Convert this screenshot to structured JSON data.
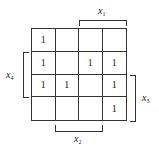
{
  "diagram": {
    "type": "karnaugh-map",
    "rows": 4,
    "cols": 4,
    "cells": [
      [
        "1",
        "",
        "",
        ""
      ],
      [
        "1",
        "",
        "1",
        "1"
      ],
      [
        "1",
        "1",
        "",
        "1"
      ],
      [
        "",
        "",
        "",
        "1"
      ]
    ],
    "labels": {
      "x1": {
        "var": "x",
        "sub": "1",
        "position": "top",
        "span_cols": [
          2,
          3
        ]
      },
      "x2": {
        "var": "x",
        "sub": "2",
        "position": "bottom",
        "span_cols": [
          1,
          2
        ]
      },
      "x3": {
        "var": "x",
        "sub": "3",
        "position": "right",
        "span_rows": [
          2,
          3
        ]
      },
      "x4": {
        "var": "x",
        "sub": "4",
        "position": "left",
        "span_rows": [
          1,
          2
        ]
      }
    },
    "colors": {
      "line": "#333333",
      "text": "#222222",
      "background": "#ffffff"
    }
  }
}
